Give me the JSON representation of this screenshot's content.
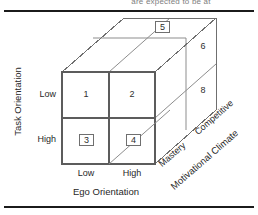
{
  "figure": {
    "clipped_caption": "are expected to be at",
    "type": "3d-cube-typology-diagram"
  },
  "axes": {
    "y": {
      "title": "Task Orientation",
      "ticks": [
        "Low",
        "High"
      ]
    },
    "x": {
      "title": "Ego Orientation",
      "ticks": [
        "Low",
        "High"
      ]
    },
    "z": {
      "title": "Motivational Climate",
      "ticks": [
        "Mastery",
        "Competitive"
      ]
    }
  },
  "cells": {
    "front_top_left": {
      "label": "1",
      "boxed": false
    },
    "front_top_right": {
      "label": "2",
      "boxed": false
    },
    "front_bottom_left": {
      "label": "3",
      "boxed": true
    },
    "front_bottom_right": {
      "label": "4",
      "boxed": true
    },
    "top_back": {
      "label": "5",
      "boxed": true
    },
    "side_upper": {
      "label": "6",
      "boxed": false
    },
    "side_lower": {
      "label": "8",
      "boxed": false
    }
  },
  "colors": {
    "rule": "#1b1b1b",
    "edge": "#6f6f6f",
    "edge_front": "#5c5c5c",
    "text": "#272727",
    "background": "#ffffff"
  }
}
